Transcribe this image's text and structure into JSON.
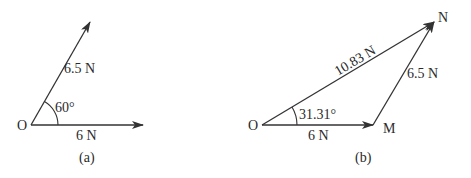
{
  "figure_a": {
    "caption": "(a)",
    "origin_label": "O",
    "vector_horizontal_label": "6 N",
    "vector_slanted_label": "6.5 N",
    "angle_label": "60°"
  },
  "figure_b": {
    "caption": "(b)",
    "origin_label": "O",
    "point_m_label": "M",
    "point_n_label": "N",
    "vector_om_label": "6 N",
    "vector_mn_label": "6.5 N",
    "vector_on_label": "10.83 N",
    "angle_label": "31.31°"
  },
  "colors": {
    "line": "#333333",
    "text": "#2a2a2a",
    "background": "#ffffff"
  }
}
